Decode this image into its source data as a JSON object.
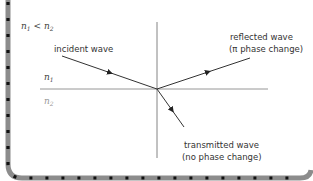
{
  "diagram": {
    "condition": {
      "n_a": "n",
      "sub_a": "1",
      "op": " < ",
      "n_b": "n",
      "sub_b": "2"
    },
    "medium_top": {
      "n": "n",
      "sub": "1"
    },
    "medium_bottom": {
      "n": "n",
      "sub": "2"
    },
    "labels": {
      "incident": "incident wave",
      "reflected_line1": "reflected wave",
      "reflected_line2": "(π phase change)",
      "transmitted_line1": "transmitted wave",
      "transmitted_line2": "(no phase change)"
    },
    "colors": {
      "line": "#333333",
      "interface": "#8a8a8a",
      "border": "#8c8c8c",
      "border_dots": "#111111"
    }
  }
}
